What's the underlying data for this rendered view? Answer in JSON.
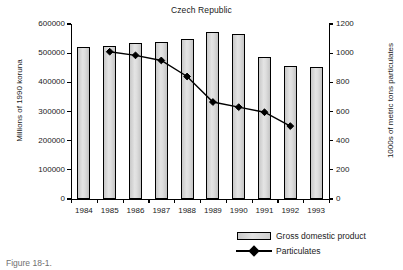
{
  "chart_data": {
    "type": "bar",
    "title": "Czech Republic",
    "xlabel": "",
    "ylabel": "Millions of 1990 koruna",
    "y2label": "1000s of metric tons particulates",
    "categories": [
      "1984",
      "1985",
      "1986",
      "1987",
      "1988",
      "1989",
      "1990",
      "1991",
      "1992",
      "1993"
    ],
    "ylim": [
      0,
      600000
    ],
    "y2lim": [
      0,
      1200
    ],
    "yticks": [
      "0",
      "100000",
      "200000",
      "300000",
      "400000",
      "500000",
      "600000"
    ],
    "ytick_values": [
      0,
      100000,
      200000,
      300000,
      400000,
      500000,
      600000
    ],
    "y2ticks": [
      "0",
      "200",
      "400",
      "600",
      "800",
      "1000",
      "1200"
    ],
    "y2tick_values": [
      0,
      200,
      400,
      600,
      800,
      1000,
      1200
    ],
    "grid": false,
    "legend_position": "bottom-right",
    "series": [
      {
        "name": "Gross domestic product",
        "type": "bar",
        "axis": "left",
        "values": [
          520000,
          525000,
          535000,
          538000,
          548000,
          572000,
          567000,
          487000,
          455000,
          453000
        ]
      },
      {
        "name": "Particulates",
        "type": "line",
        "axis": "right",
        "marker": "diamond",
        "values": [
          null,
          1010,
          985,
          950,
          840,
          665,
          630,
          595,
          500,
          null
        ]
      }
    ]
  },
  "legend": {
    "items": [
      {
        "label": "Gross domestic product",
        "swatch": "bar-swatch-icon"
      },
      {
        "label": "Particulates",
        "swatch": "line-diamond-icon"
      }
    ]
  },
  "caption": {
    "text": "Figure 18-1."
  }
}
